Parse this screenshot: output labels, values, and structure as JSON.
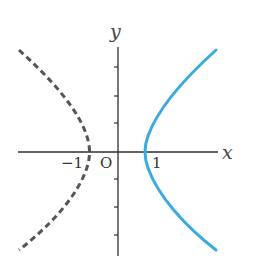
{
  "diagram": {
    "type": "hyperbola-graph",
    "axes": {
      "x_label": "x",
      "y_label": "y",
      "origin_label": "O"
    },
    "tick_labels": {
      "neg_one": "−1",
      "pos_one": "1"
    },
    "curves": [
      {
        "name": "right-branch",
        "style": "solid",
        "color": "#3aabe0"
      },
      {
        "name": "left-branch",
        "style": "dashed",
        "color": "#555555"
      }
    ]
  }
}
